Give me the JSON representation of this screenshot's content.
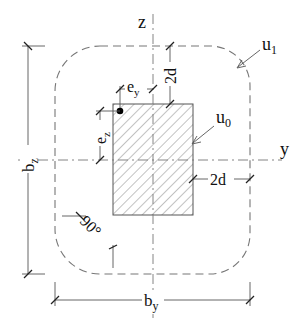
{
  "diagram": {
    "colors": {
      "line": "#555555",
      "dash": "#777777",
      "hatch": "#777777",
      "text": "#111111",
      "point": "#000000"
    },
    "axes": {
      "z_label": "z",
      "y_label": "y"
    },
    "perimeters": {
      "u0_label": "u",
      "u0_sub": "0",
      "u1_label": "u",
      "u1_sub": "1"
    },
    "dimensions": {
      "bz_label": "b",
      "bz_sub": "z",
      "by_label": "b",
      "by_sub": "y",
      "top_offset": "2d",
      "right_offset": "2d",
      "ey_label": "e",
      "ey_sub": "y",
      "ez_label": "e",
      "ez_sub": "z",
      "angle": "90°"
    }
  }
}
